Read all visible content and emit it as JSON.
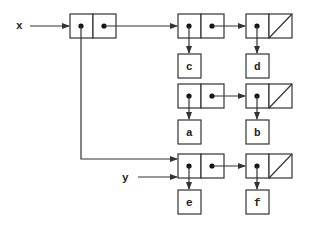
{
  "diagram": {
    "type": "box-and-pointer",
    "variables": [
      {
        "name": "x",
        "points_to": "pair-x"
      },
      {
        "name": "y",
        "points_to": "pair-e"
      }
    ],
    "pairs": [
      {
        "id": "pair-x",
        "car": "pair-c",
        "cdr": "pair-ab"
      },
      {
        "id": "pair-c",
        "car": "c",
        "cdr": "pair-d"
      },
      {
        "id": "pair-d",
        "car": "d",
        "cdr": "nil"
      },
      {
        "id": "pair-ab",
        "car": "a",
        "cdr": "pair-b"
      },
      {
        "id": "pair-b",
        "car": "b",
        "cdr": "nil"
      },
      {
        "id": "pair-e",
        "car": "e",
        "cdr": "pair-f"
      },
      {
        "id": "pair-f",
        "car": "f",
        "cdr": "nil"
      }
    ],
    "atoms": [
      "c",
      "d",
      "a",
      "b",
      "e",
      "f"
    ],
    "labels": {
      "x": "x",
      "y": "y",
      "c": "c",
      "d": "d",
      "a": "a",
      "b": "b",
      "e": "e",
      "f": "f"
    }
  }
}
